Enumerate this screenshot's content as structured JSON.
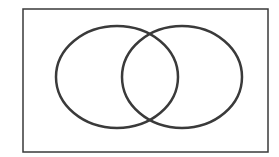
{
  "diagram": {
    "type": "venn",
    "background": "#ffffff",
    "stroke_color": "#3a3a3a",
    "universe": {
      "x": 23,
      "y": 9,
      "width": 245,
      "height": 143,
      "stroke_width": 1.5
    },
    "sets": [
      {
        "id": "left-set",
        "cx": 117,
        "cy": 77,
        "rx": 61,
        "ry": 51,
        "stroke_width": 2.5
      },
      {
        "id": "right-set",
        "cx": 182,
        "cy": 77,
        "rx": 60,
        "ry": 51,
        "stroke_width": 2.5
      }
    ]
  }
}
